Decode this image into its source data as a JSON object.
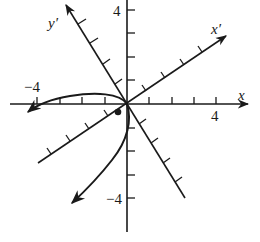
{
  "figure": {
    "axes": {
      "x": {
        "label": "x",
        "tick_label_pos": "4"
      },
      "y": {
        "label": "",
        "tick_label_pos": "4",
        "tick_label_neg": "-4"
      },
      "x_rot": {
        "label": "x′"
      },
      "y_rot": {
        "label": "y′"
      },
      "x_neg_label": "−4",
      "y_neg_label": "−4"
    },
    "ticks_per_half_axis": 4,
    "curve": "parabola through origin opening toward lower-left",
    "marked_point": "vertex dot near origin",
    "colors": {
      "ink": "#1a1a1a",
      "background": "#ffffff"
    }
  }
}
